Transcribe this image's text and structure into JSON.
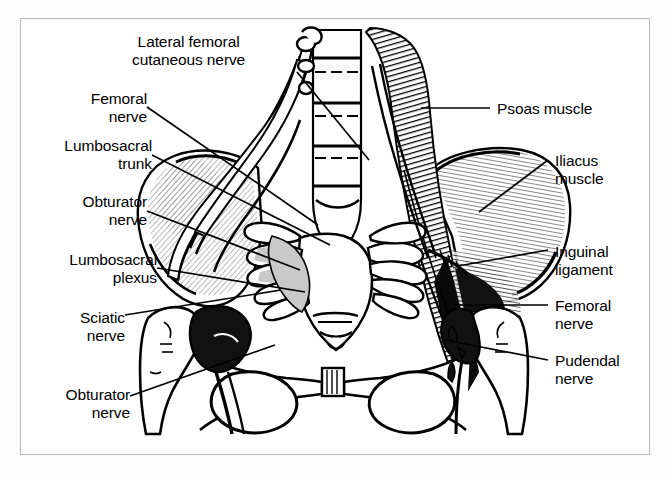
{
  "figure": {
    "type": "anatomical-line-illustration",
    "view": "anterior view of pelvis, lumbar spine and sacrum",
    "border_color": "#b9b9b9",
    "background_color": "#ffffff",
    "ink_color": "#000000",
    "shade_color": "#c9c9c9"
  },
  "labels": {
    "left": [
      {
        "id": "lateral-femoral-cutaneous-nerve",
        "lines": [
          "Lateral femoral",
          "cutaneous nerve"
        ],
        "align": "center",
        "x": 132,
        "y": 33
      },
      {
        "id": "femoral-nerve",
        "lines": [
          "Femoral",
          "nerve"
        ],
        "align": "right",
        "x": 62,
        "y": 90
      },
      {
        "id": "lumbosacral-trunk",
        "lines": [
          "Lumbosacral",
          "trunk"
        ],
        "align": "right",
        "x": 30,
        "y": 137
      },
      {
        "id": "obturator-nerve-upper",
        "lines": [
          "Obturator",
          "nerve"
        ],
        "align": "right",
        "x": 40,
        "y": 193
      },
      {
        "id": "lumbosacral-plexus",
        "lines": [
          "Lumbosacral",
          "plexus"
        ],
        "align": "right",
        "x": 33,
        "y": 251
      },
      {
        "id": "sciatic-nerve",
        "lines": [
          "Sciatic",
          "nerve"
        ],
        "align": "right",
        "x": 60,
        "y": 309
      },
      {
        "id": "obturator-nerve-lower",
        "lines": [
          "Obturator",
          "nerve"
        ],
        "align": "right",
        "x": 40,
        "y": 386
      }
    ],
    "right": [
      {
        "id": "psoas-muscle",
        "lines": [
          "Psoas muscle"
        ],
        "align": "left",
        "x": 497,
        "y": 100
      },
      {
        "id": "iliacus-muscle",
        "lines": [
          "Iliacus",
          "muscle"
        ],
        "align": "left",
        "x": 555,
        "y": 152
      },
      {
        "id": "inguinal-ligament",
        "lines": [
          "Inguinal",
          "ligament"
        ],
        "align": "left",
        "x": 555,
        "y": 243
      },
      {
        "id": "femoral-nerve-right",
        "lines": [
          "Femoral",
          "nerve"
        ],
        "align": "left",
        "x": 555,
        "y": 297
      },
      {
        "id": "pudendal-nerve",
        "lines": [
          "Pudendal",
          "nerve"
        ],
        "align": "left",
        "x": 555,
        "y": 352
      }
    ]
  },
  "leader_lines": [
    {
      "id": "leader-lateral-femoral-cutaneous-nerve",
      "x1": 297,
      "y1": 72,
      "x2": 369,
      "y2": 160
    },
    {
      "id": "leader-femoral-nerve",
      "x1": 147,
      "y1": 107,
      "x2": 318,
      "y2": 225
    },
    {
      "id": "leader-lumbosacral-trunk",
      "x1": 152,
      "y1": 155,
      "x2": 330,
      "y2": 245
    },
    {
      "id": "leader-obturator-nerve-upper",
      "x1": 147,
      "y1": 211,
      "x2": 300,
      "y2": 270
    },
    {
      "id": "leader-lumbosacral-plexus",
      "x1": 157,
      "y1": 268,
      "x2": 305,
      "y2": 292
    },
    {
      "id": "leader-sciatic-nerve",
      "x1": 125,
      "y1": 315,
      "x2": 281,
      "y2": 290
    },
    {
      "id": "leader-obturator-nerve-lower",
      "x1": 130,
      "y1": 396,
      "x2": 275,
      "y2": 345
    },
    {
      "id": "leader-psoas-muscle",
      "x1": 490,
      "y1": 108,
      "x2": 421,
      "y2": 108
    },
    {
      "id": "leader-iliacus-muscle",
      "x1": 548,
      "y1": 160,
      "x2": 479,
      "y2": 212
    },
    {
      "id": "leader-inguinal-ligament",
      "x1": 548,
      "y1": 250,
      "x2": 458,
      "y2": 266
    },
    {
      "id": "leader-femoral-nerve-right",
      "x1": 548,
      "y1": 305,
      "x2": 455,
      "y2": 305
    },
    {
      "id": "leader-pudendal-nerve",
      "x1": 548,
      "y1": 360,
      "x2": 445,
      "y2": 340
    }
  ],
  "structures": [
    {
      "id": "lumbar-vertebral-column",
      "name": "Lumbar vertebral bodies"
    },
    {
      "id": "sacrum",
      "name": "Sacrum"
    },
    {
      "id": "left-ilium",
      "name": "Left ilium / iliac fossa"
    },
    {
      "id": "right-ilium",
      "name": "Right ilium / iliac fossa"
    },
    {
      "id": "psoas-muscle-body",
      "name": "Psoas major muscle"
    },
    {
      "id": "iliacus-muscle-body",
      "name": "Iliacus muscle"
    },
    {
      "id": "nerve-roots-left",
      "name": "Left lumbosacral nerve roots"
    },
    {
      "id": "nerve-roots-right",
      "name": "Right lumbosacral nerve roots"
    },
    {
      "id": "pubic-symphysis",
      "name": "Pubic symphysis"
    },
    {
      "id": "obturator-foramen-left",
      "name": "Left obturator foramen"
    },
    {
      "id": "obturator-foramen-right",
      "name": "Right obturator foramen"
    },
    {
      "id": "femoral-head-left",
      "name": "Left femoral head"
    },
    {
      "id": "femoral-head-right",
      "name": "Right femoral head"
    },
    {
      "id": "inguinal-ligament-band",
      "name": "Inguinal ligament"
    }
  ]
}
